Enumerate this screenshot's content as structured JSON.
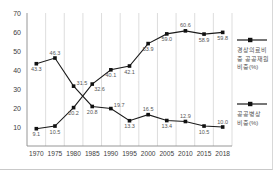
{
  "chart_data": {
    "type": "line",
    "categories": [
      "1970",
      "1975",
      "1980",
      "1985",
      "1990",
      "1995",
      "2000",
      "2005",
      "2010",
      "2015",
      "2018"
    ],
    "series": [
      {
        "name": "경상의료비 중 공공재원 비중(%)",
        "values": [
          9.1,
          10.5,
          20.2,
          32.6,
          40.1,
          42.1,
          53.9,
          59.0,
          60.6,
          58.9,
          59.8
        ],
        "labels": [
          "9.1",
          "10.5",
          "20.2",
          "32.6",
          "40.1",
          "42.1",
          "53.9",
          "59.0",
          "60.6",
          "58.9",
          "59.8"
        ],
        "label_positions": [
          "below",
          "below",
          "below",
          "below-right",
          "below",
          "below",
          "below",
          "below",
          "above",
          "below",
          "below"
        ]
      },
      {
        "name": "공공병상 비중(%)",
        "values": [
          43.3,
          46.3,
          31.5,
          20.8,
          19.7,
          13.3,
          16.5,
          13.4,
          12.9,
          10.5,
          10.0
        ],
        "labels": [
          "43.3",
          "46.3",
          "31.5",
          "20.8",
          "19.7",
          "13.3",
          "16.5",
          "13.4",
          "12.9",
          "10.5",
          "10.0"
        ],
        "label_positions": [
          "below",
          "above",
          "above-right",
          "below",
          "above-right",
          "below",
          "above",
          "below",
          "above",
          "below",
          "above"
        ]
      }
    ],
    "title": "",
    "xlabel": "",
    "ylabel": "",
    "ylim": [
      0,
      70
    ],
    "yticks": [
      10,
      20,
      30,
      40,
      50,
      60,
      70
    ],
    "grid": "vertical-only",
    "legend_position": "right",
    "line_color": "#1a1a1a",
    "marker": "square",
    "marker_color": "#111111",
    "value_label_color": "#555555",
    "axis_label_color": "#3d3d3d",
    "gridline_color": "#cfcfcf",
    "axis_line_color": "#8a8a8a"
  }
}
